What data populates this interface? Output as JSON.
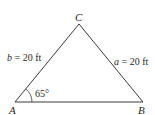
{
  "diagram": {
    "type": "triangle",
    "vertices": {
      "A": {
        "label": "A",
        "x": 15,
        "y": 102
      },
      "B": {
        "label": "B",
        "x": 143,
        "y": 102
      },
      "C": {
        "label": "C",
        "x": 79,
        "y": 24
      }
    },
    "sides": {
      "b": {
        "var": "b",
        "text": " = 20 ft",
        "between": [
          "A",
          "C"
        ]
      },
      "a": {
        "var": "a",
        "text": " = 20 ft",
        "between": [
          "B",
          "C"
        ]
      }
    },
    "angle": {
      "at": "A",
      "label": "65°"
    },
    "colors": {
      "line": "#3a3a3a",
      "text": "#2a2a2a",
      "background": "#ffffff"
    }
  }
}
